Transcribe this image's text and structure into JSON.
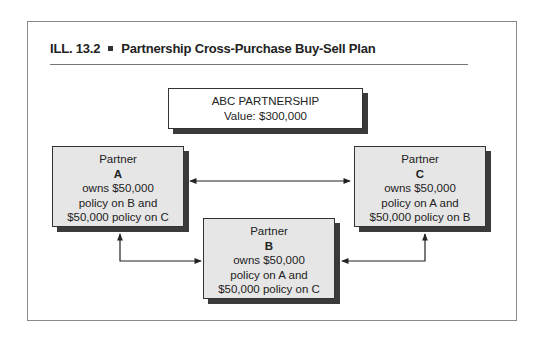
{
  "figure": {
    "label": "ILL. 13.2",
    "title": "Partnership Cross-Purchase Buy-Sell Plan"
  },
  "entity": {
    "name": "ABC PARTNERSHIP",
    "value": "Value: $300,000"
  },
  "partners": [
    {
      "heading": "Partner",
      "id": "A",
      "line1": "owns $50,000",
      "line2": "policy on B and",
      "line3": "$50,000 policy on C"
    },
    {
      "heading": "Partner",
      "id": "B",
      "line1": "owns $50,000",
      "line2": "policy on A and",
      "line3": "$50,000 policy on C"
    },
    {
      "heading": "Partner",
      "id": "C",
      "line1": "owns $50,000",
      "line2": "policy on A and",
      "line3": "$50,000 policy on B"
    }
  ],
  "connections": [
    {
      "from": "A",
      "to": "C",
      "type": "bidirectional"
    },
    {
      "from": "A",
      "to": "B",
      "type": "bidirectional"
    },
    {
      "from": "B",
      "to": "C",
      "type": "bidirectional"
    }
  ],
  "colors": {
    "box_fill": "#e6e6e6",
    "shadow": "#3a3a3a",
    "frame": "#8a8a8a"
  }
}
